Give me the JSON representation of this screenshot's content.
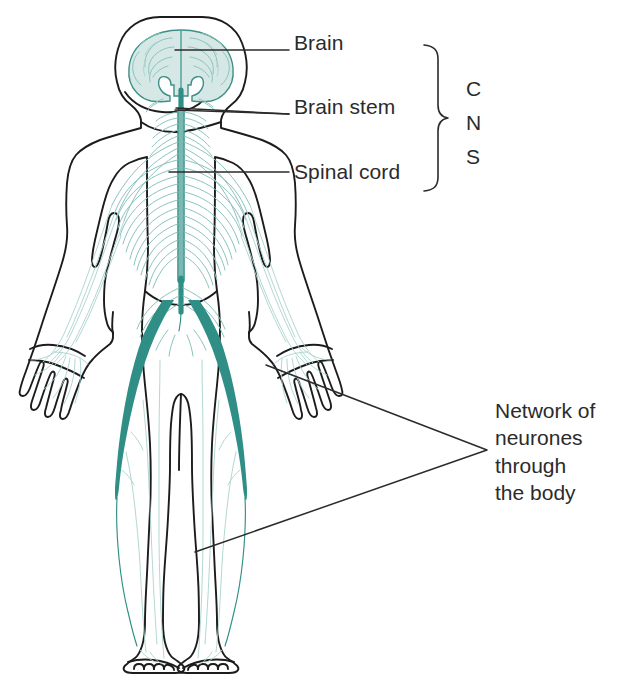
{
  "figure": {
    "background_color": "#ffffff"
  },
  "colors": {
    "body_outline": "#1c1c1c",
    "nerve_teal": "#2f8f86",
    "nerve_light": "#7fb9b3",
    "brain_fill": "#d5e8e6",
    "brain_outline": "#3d8f88",
    "leader_line": "#2b2b2b",
    "text": "#2b2b2b"
  },
  "labels": {
    "brain": "Brain",
    "brain_stem": "Brain stem",
    "spinal_cord": "Spinal cord"
  },
  "cns": {
    "letters": [
      "C",
      "N",
      "S"
    ],
    "expansion": "CNS"
  },
  "network_callout": {
    "lines": [
      "Network of",
      "neurones",
      "through",
      "the body"
    ]
  },
  "icons": {
    "brain": "brain-icon",
    "spinal_cord": "spinal-cord-icon",
    "human_body": "human-body-icon",
    "cns_bracket": "curly-brace-icon"
  }
}
